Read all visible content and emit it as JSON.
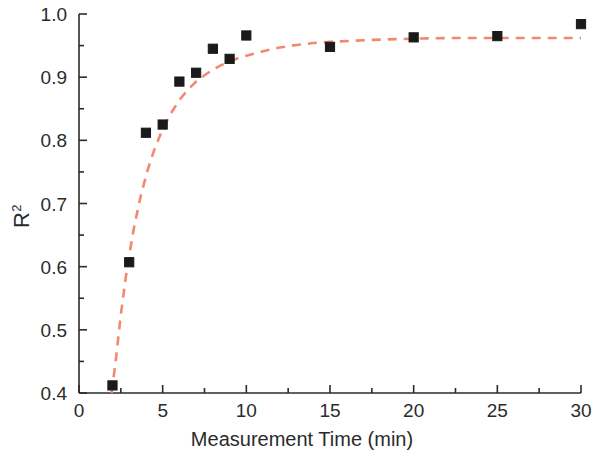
{
  "chart_data": {
    "type": "scatter",
    "title": "",
    "xlabel": "Measurement Time (min)",
    "ylabel": "R²",
    "xlim": [
      0,
      30
    ],
    "ylim": [
      0.4,
      1.0
    ],
    "xticks": [
      0,
      5,
      10,
      15,
      20,
      25,
      30
    ],
    "xtick_labels": [
      "0",
      "5",
      "10",
      "15",
      "20",
      "25",
      "30"
    ],
    "yticks": [
      0.4,
      0.5,
      0.6,
      0.7,
      0.8,
      0.9,
      1.0
    ],
    "ytick_labels": [
      "0.4",
      "0.5",
      "0.6",
      "0.7",
      "0.8",
      "0.9",
      "1.0"
    ],
    "x_minor_ticks": [
      2.5,
      7.5,
      12.5,
      17.5,
      22.5,
      27.5
    ],
    "y_minor_ticks": [
      0.45,
      0.55,
      0.65,
      0.75,
      0.85,
      0.95
    ],
    "grid": false,
    "legend": null,
    "marker_style": "filled-square",
    "marker_color": "#1a1a1a",
    "fit_line_color": "#F4876F",
    "fit_line_style": "dashed",
    "series": [
      {
        "name": "R2 vs measurement time",
        "x": [
          2,
          3,
          4,
          5,
          6,
          7,
          8,
          9,
          10,
          15,
          20,
          25,
          30
        ],
        "values": [
          0.412,
          0.607,
          0.812,
          0.825,
          0.893,
          0.907,
          0.945,
          0.929,
          0.966,
          0.948,
          0.963,
          0.965,
          0.984
        ]
      }
    ],
    "fit_curve": {
      "name": "exponential rise to plateau (dashed)",
      "x": [
        1.95,
        2.2,
        2.5,
        2.8,
        3.0,
        3.3,
        3.7,
        4.1,
        4.5,
        5.0,
        5.5,
        6.0,
        6.5,
        7.0,
        7.5,
        8.0,
        8.5,
        9.0,
        9.5,
        10.0,
        11.0,
        12.0,
        13.0,
        14.0,
        15.0,
        17.5,
        20.0,
        22.5,
        25.0,
        27.5,
        30.0
      ],
      "y": [
        0.4,
        0.452,
        0.524,
        0.584,
        0.618,
        0.664,
        0.713,
        0.753,
        0.785,
        0.818,
        0.843,
        0.864,
        0.88,
        0.893,
        0.903,
        0.912,
        0.919,
        0.925,
        0.93,
        0.934,
        0.941,
        0.947,
        0.951,
        0.954,
        0.956,
        0.959,
        0.961,
        0.962,
        0.962,
        0.962,
        0.962
      ]
    }
  }
}
